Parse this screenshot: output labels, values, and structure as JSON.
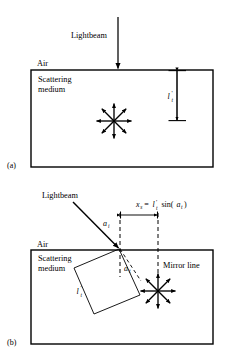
{
  "figure": {
    "kind": "optics-scattering-diagram",
    "panels": [
      {
        "id": "a",
        "panel_label": "(a)",
        "beam_label": "Lightbeam",
        "outside_medium_label": "Air",
        "medium_label_line1": "Scattering",
        "medium_label_line2": "medium",
        "depth_symbol": "l",
        "depth_prime": "'",
        "depth_subscript": "t",
        "beam_orientation": "normal-incidence",
        "scatter_rays": 8
      },
      {
        "id": "b",
        "panel_label": "(b)",
        "beam_label": "Lightbeam",
        "outside_medium_label": "Air",
        "medium_label_line1": "Scattering",
        "medium_label_line2": "medium",
        "mirror_line_label": "Mirror line",
        "incidence_angle_symbol": "a",
        "incidence_angle_subscript": "i",
        "transmission_angle_symbol": "a",
        "transmission_angle_subscript": "t",
        "path_symbol": "l",
        "path_prime": "'",
        "path_subscript": "t",
        "formula": {
          "lhs_symbol": "x",
          "lhs_subscript": "s",
          "equals": "=",
          "rhs_symbol": "l",
          "rhs_prime": "'",
          "rhs_subscript": "t",
          "rhs_function": "sin(",
          "rhs_arg_symbol": "a",
          "rhs_arg_subscript": "t",
          "rhs_close": ")",
          "plain": "x_s = l'_t sin(a_t)"
        },
        "beam_orientation": "oblique-incidence",
        "scatter_rays": 8
      }
    ],
    "colors": {
      "stroke": "#000000",
      "background": "#ffffff",
      "dashed": "#000000"
    }
  }
}
